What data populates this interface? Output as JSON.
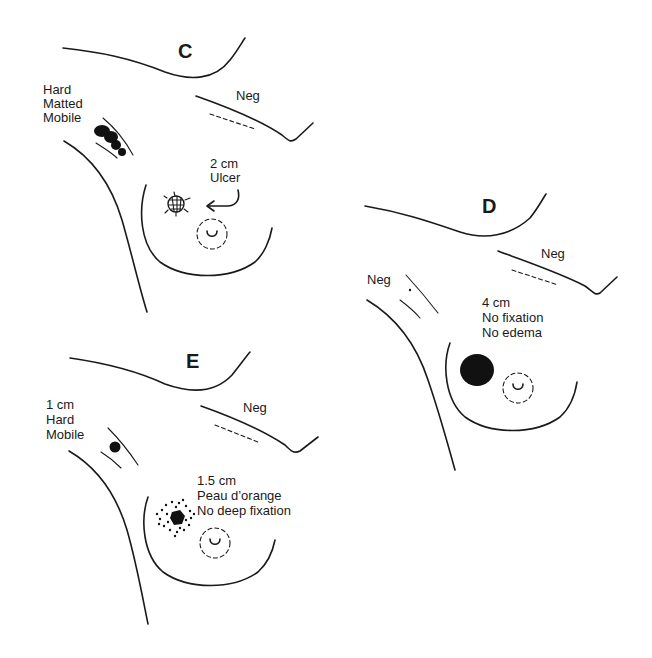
{
  "panels": {
    "C": {
      "letter": "C",
      "axilla_note": [
        "Hard",
        "Matted",
        "Mobile"
      ],
      "contralateral_note": "Neg",
      "lesion_note": [
        "2 cm",
        "Ulcer"
      ],
      "lesion_type": "ulcer"
    },
    "D": {
      "letter": "D",
      "axilla_note": [
        "Neg"
      ],
      "contralateral_note": "Neg",
      "lesion_note": [
        "4 cm",
        "No fixation",
        "No edema"
      ],
      "lesion_type": "solid-mass"
    },
    "E": {
      "letter": "E",
      "axilla_note": [
        "1 cm",
        "Hard",
        "Mobile"
      ],
      "contralateral_note": "Neg",
      "lesion_note": [
        "1.5 cm",
        "Peau d’orange",
        "No deep fixation"
      ],
      "lesion_type": "peau-d-orange-mass"
    }
  },
  "colors": {
    "ink": "#1a1a1a",
    "background": "#ffffff"
  }
}
